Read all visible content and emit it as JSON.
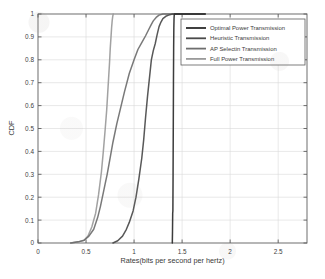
{
  "chart_data": {
    "type": "line",
    "title": "",
    "xlabel": "Rates(bits per second per hertz)",
    "ylabel": "CDF",
    "xlim": [
      0,
      2.8
    ],
    "ylim": [
      0,
      1
    ],
    "xticks": [
      "0",
      "0.5",
      "1",
      "1.5",
      "2",
      "2.5"
    ],
    "xtick_values": [
      0,
      0.5,
      1,
      1.5,
      2,
      2.5
    ],
    "yticks": [
      "0",
      "0.1",
      "0.2",
      "0.3",
      "0.4",
      "0.5",
      "0.6",
      "0.7",
      "0.8",
      "0.9",
      "1"
    ],
    "ytick_values": [
      0,
      0.1,
      0.2,
      0.3,
      0.4,
      0.5,
      0.6,
      0.7,
      0.8,
      0.9,
      1
    ],
    "grid": true,
    "legend_position": "top-right",
    "series": [
      {
        "name": "Optimal Power Transmission",
        "color": "#2b2b2b",
        "x": [
          1.398,
          1.4,
          1.402,
          1.404,
          1.406,
          1.408,
          1.41,
          1.412,
          1.414,
          1.416,
          1.418,
          1.42,
          1.74
        ],
        "y": [
          0.0,
          0.05,
          0.13,
          0.14,
          0.3,
          0.5,
          0.7,
          0.85,
          0.94,
          0.98,
          0.995,
          1.0,
          1.0
        ]
      },
      {
        "name": "Heuristic Transmission",
        "color": "#4a4a4a",
        "x": [
          0.78,
          0.83,
          0.88,
          0.92,
          0.95,
          0.99,
          1.02,
          1.05,
          1.08,
          1.1,
          1.12,
          1.14,
          1.16,
          1.18,
          1.2,
          1.22,
          1.24,
          1.26,
          1.28,
          1.3,
          1.33,
          1.36,
          1.4,
          1.74
        ],
        "y": [
          0.0,
          0.01,
          0.03,
          0.06,
          0.09,
          0.14,
          0.2,
          0.28,
          0.37,
          0.45,
          0.55,
          0.64,
          0.72,
          0.8,
          0.84,
          0.87,
          0.91,
          0.945,
          0.965,
          0.98,
          0.99,
          0.995,
          1.0,
          1.0
        ]
      },
      {
        "name": "AP Selectin Transmission",
        "color": "#6e6e6e",
        "x": [
          0.34,
          0.42,
          0.48,
          0.53,
          0.58,
          0.62,
          0.65,
          0.68,
          0.7,
          0.72,
          0.75,
          0.78,
          0.82,
          0.86,
          0.9,
          0.95,
          1.0,
          1.04,
          1.08,
          1.12,
          1.15,
          1.18,
          1.2,
          1.23,
          1.26,
          1.3,
          1.74
        ],
        "y": [
          0.0,
          0.005,
          0.012,
          0.03,
          0.06,
          0.11,
          0.16,
          0.22,
          0.26,
          0.3,
          0.37,
          0.44,
          0.52,
          0.59,
          0.66,
          0.74,
          0.8,
          0.845,
          0.875,
          0.905,
          0.93,
          0.955,
          0.97,
          0.985,
          0.995,
          1.0,
          1.0
        ]
      },
      {
        "name": "Full Power Transmission",
        "color": "#9a9a9a",
        "x": [
          0.34,
          0.42,
          0.48,
          0.52,
          0.56,
          0.6,
          0.63,
          0.66,
          0.68,
          0.7,
          0.715,
          0.725,
          0.735,
          0.745,
          0.752,
          0.76,
          0.766,
          0.772,
          0.778,
          0.783
        ],
        "y": [
          0.0,
          0.005,
          0.012,
          0.03,
          0.07,
          0.13,
          0.21,
          0.31,
          0.4,
          0.5,
          0.58,
          0.65,
          0.72,
          0.79,
          0.85,
          0.9,
          0.94,
          0.97,
          0.99,
          1.0
        ]
      }
    ]
  },
  "legend": {
    "items": [
      {
        "label": "Optimal Power Transmission"
      },
      {
        "label": "Heuristic Transmission"
      },
      {
        "label": "AP Selectin Transmission"
      },
      {
        "label": "Full Power Transmission"
      }
    ]
  }
}
